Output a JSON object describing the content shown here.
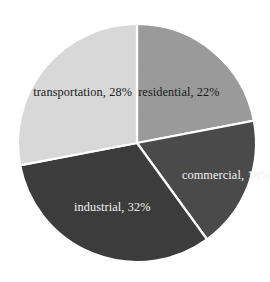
{
  "chart_data": {
    "type": "pie",
    "title": "",
    "subtitle": "",
    "xlabel": "",
    "ylabel": "",
    "grid": false,
    "legend_position": "none",
    "labels_inside_slices": true,
    "start_angle_deg": 0,
    "direction": "clockwise",
    "categories": [
      "residential",
      "commercial",
      "industrial",
      "transportation"
    ],
    "values": [
      22,
      18,
      32,
      28
    ],
    "units": "%",
    "slices": [
      {
        "name": "residential",
        "value": 22,
        "label": "residential, 22%",
        "color": "#9a9a9a",
        "text_color": "#1a1a1a",
        "start_deg": 0,
        "end_deg": 79.2
      },
      {
        "name": "commercial",
        "value": 18,
        "label": "commercial, 18%",
        "color": "#4a4a4a",
        "text_color": "#f2f2f2",
        "start_deg": 79.2,
        "end_deg": 144
      },
      {
        "name": "industrial",
        "value": 32,
        "label": "industrial, 32%",
        "color": "#3c3c3c",
        "text_color": "#f2f2f2",
        "start_deg": 144,
        "end_deg": 259.2
      },
      {
        "name": "transportation",
        "value": 28,
        "label": "transportation, 28%",
        "color": "#d8d8d8",
        "text_color": "#1a1a1a",
        "start_deg": 259.2,
        "end_deg": 360
      }
    ],
    "geometry": {
      "center_x": 137,
      "center_y": 143,
      "radius": 119
    },
    "style": {
      "background": "#ffffff",
      "divider_color": "#ffffff",
      "divider_width": 2.2
    }
  }
}
